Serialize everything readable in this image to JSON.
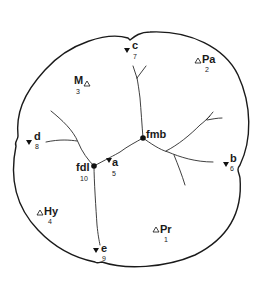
{
  "diagram": {
    "type": "tooth-occlusal-surface",
    "colors": {
      "line": "#1a1a1a",
      "background": "#ffffff"
    },
    "fossae": [
      {
        "label": "fmb",
        "symbol": "filled-circle",
        "x": 143,
        "y": 138
      },
      {
        "label": "fdl",
        "number": "10",
        "symbol": "filled-circle",
        "x": 94,
        "y": 166
      }
    ],
    "cusps": [
      {
        "label": "Pr",
        "number": "1",
        "symbol": "open-triangle",
        "x": 160,
        "y": 229
      },
      {
        "label": "Pa",
        "number": "2",
        "symbol": "open-triangle",
        "x": 200,
        "y": 61
      },
      {
        "label": "M",
        "number": "3",
        "symbol": "open-triangle",
        "x": 85,
        "y": 82
      },
      {
        "label": "Hy",
        "number": "4",
        "symbol": "open-triangle",
        "x": 45,
        "y": 211
      }
    ],
    "ridges": [
      {
        "label": "a",
        "number": "5",
        "symbol": "filled-triangle",
        "x": 108,
        "y": 160
      },
      {
        "label": "b",
        "number": "6",
        "symbol": "filled-triangle",
        "x": 226,
        "y": 165
      },
      {
        "label": "c",
        "number": "7",
        "symbol": "filled-triangle",
        "x": 127,
        "y": 50
      },
      {
        "label": "d",
        "number": "8",
        "symbol": "filled-triangle",
        "x": 29,
        "y": 141
      },
      {
        "label": "e",
        "number": "9",
        "symbol": "filled-triangle",
        "x": 97,
        "y": 250
      }
    ]
  }
}
